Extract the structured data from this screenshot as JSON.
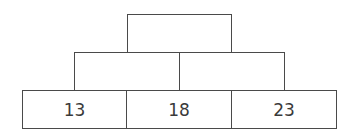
{
  "diagram": {
    "type": "number-pyramid",
    "line_color": "#4a4a4a",
    "rows": [
      {
        "row": "top",
        "cells": [
          {
            "value": ""
          }
        ]
      },
      {
        "row": "middle",
        "cells": [
          {
            "value": ""
          },
          {
            "value": ""
          }
        ]
      },
      {
        "row": "bottom",
        "cells": [
          {
            "value": "13"
          },
          {
            "value": "18"
          },
          {
            "value": "23"
          }
        ]
      }
    ]
  }
}
